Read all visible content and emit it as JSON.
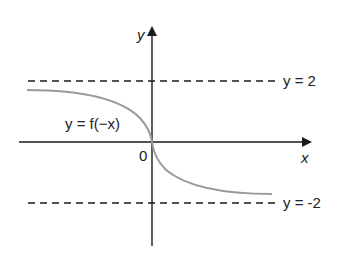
{
  "diagram": {
    "axes": {
      "x_label": "x",
      "y_label": "y",
      "origin_label": "0"
    },
    "asymptotes": [
      {
        "label": "y = 2",
        "value": 2
      },
      {
        "label": "y = -2",
        "value": -2
      }
    ],
    "curve": {
      "label": "y = f(−x)",
      "color": "#9a9a9a"
    },
    "colors": {
      "axis": "#1a1a1a",
      "dashed": "#1a1a1a",
      "curve": "#9a9a9a"
    }
  }
}
